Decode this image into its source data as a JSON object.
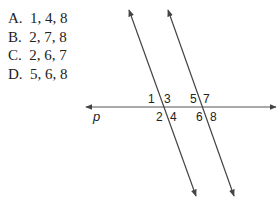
{
  "choices": [
    {
      "letter": "A.",
      "values": "1, 4, 8"
    },
    {
      "letter": "B.",
      "values": "2, 7, 8"
    },
    {
      "letter": "C.",
      "values": "2, 6, 7"
    },
    {
      "letter": "D.",
      "values": "5, 6, 8"
    }
  ],
  "diagram": {
    "line_label": "p",
    "angle_labels": [
      "1",
      "2",
      "3",
      "4",
      "5",
      "6",
      "7",
      "8"
    ],
    "line_color": "#444444"
  }
}
